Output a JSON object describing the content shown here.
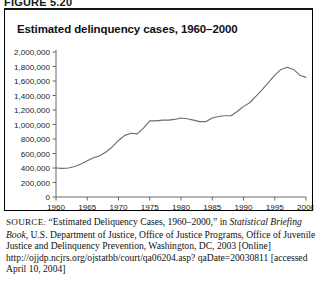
{
  "figure": {
    "label": "FIGURE 5.20"
  },
  "chart_title": "Estimated delinquency cases, 1960–2000",
  "chart_data": {
    "type": "line",
    "title": "Estimated delinquency cases, 1960–2000",
    "xlabel": "",
    "ylabel": "",
    "xlim": [
      1960,
      2000
    ],
    "ylim": [
      0,
      2000000
    ],
    "grid": false,
    "legend": "none",
    "x_ticks": [
      1960,
      1965,
      1970,
      1975,
      1980,
      1985,
      1990,
      1995,
      2000
    ],
    "x_tick_labels": [
      "1960",
      "1965",
      "1970",
      "1975",
      "1980",
      "1985",
      "1990",
      "1995",
      "2000"
    ],
    "y_ticks": [
      0,
      200000,
      400000,
      600000,
      800000,
      1000000,
      1200000,
      1400000,
      1600000,
      1800000,
      2000000
    ],
    "y_tick_labels": [
      "0",
      "200,000",
      "400,000",
      "600,000",
      "800,000",
      "1,000,000",
      "1,200,000",
      "1,400,000",
      "1,600,000",
      "1,800,000",
      "2,000,000"
    ],
    "line_color": "#6b6b6b",
    "x": [
      1960,
      1961,
      1962,
      1963,
      1964,
      1965,
      1966,
      1967,
      1968,
      1969,
      1970,
      1971,
      1972,
      1973,
      1974,
      1975,
      1976,
      1977,
      1978,
      1979,
      1980,
      1981,
      1982,
      1983,
      1984,
      1985,
      1986,
      1987,
      1988,
      1989,
      1990,
      1991,
      1992,
      1993,
      1994,
      1995,
      1996,
      1997,
      1998,
      1999,
      2000
    ],
    "values": [
      400000,
      395000,
      400000,
      420000,
      455000,
      500000,
      540000,
      570000,
      620000,
      690000,
      780000,
      850000,
      880000,
      870000,
      950000,
      1050000,
      1050000,
      1060000,
      1060000,
      1070000,
      1090000,
      1080000,
      1060000,
      1040000,
      1040000,
      1090000,
      1110000,
      1120000,
      1120000,
      1180000,
      1250000,
      1300000,
      1390000,
      1480000,
      1580000,
      1680000,
      1760000,
      1790000,
      1760000,
      1680000,
      1650000
    ]
  },
  "source": {
    "label": "SOURCE:",
    "lines": [
      {
        "segments": [
          {
            "text": "“Estimated Deliquency Cases, 1960–2000,” in ",
            "italic": false
          },
          {
            "text": "Statistical",
            "italic": true
          }
        ]
      },
      {
        "segments": [
          {
            "text": "Briefing Book,",
            "italic": true
          },
          {
            "text": " U.S. Department of Justice, Office of Justice Programs,",
            "italic": false
          }
        ]
      },
      {
        "segments": [
          {
            "text": "Office of Juvenile Justice and Delinquency Prevention, Washington,",
            "italic": false
          }
        ]
      },
      {
        "segments": [
          {
            "text": "DC, 2003 [Online] http://ojjdp.ncjrs.org/ojstatbb/court/qa06204.asp?",
            "italic": false
          }
        ]
      },
      {
        "segments": [
          {
            "text": "qaDate=20030811 [accessed April 10, 2004]",
            "italic": false
          }
        ]
      }
    ]
  }
}
